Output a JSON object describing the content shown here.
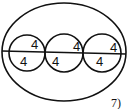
{
  "figure": {
    "number_label": "7)",
    "outer_ellipse": {
      "cx": 64,
      "cy": 52,
      "rx": 62,
      "ry": 49
    },
    "inner_circles": [
      {
        "cx": 27,
        "cy": 53,
        "r": 18
      },
      {
        "cx": 64,
        "cy": 53,
        "r": 19
      },
      {
        "cx": 102,
        "cy": 53,
        "r": 19
      }
    ],
    "diameter_line": {
      "x1": 2,
      "y1": 51,
      "x2": 126,
      "y2": 54
    },
    "labels": [
      {
        "text": "4",
        "x": 31,
        "y": 49
      },
      {
        "text": "4",
        "x": 20,
        "y": 66
      },
      {
        "text": "4",
        "x": 73,
        "y": 51
      },
      {
        "text": "4",
        "x": 52,
        "y": 66
      },
      {
        "text": "4",
        "x": 110,
        "y": 52
      },
      {
        "text": "4",
        "x": 96,
        "y": 66
      }
    ],
    "stroke_color": "#111111"
  }
}
